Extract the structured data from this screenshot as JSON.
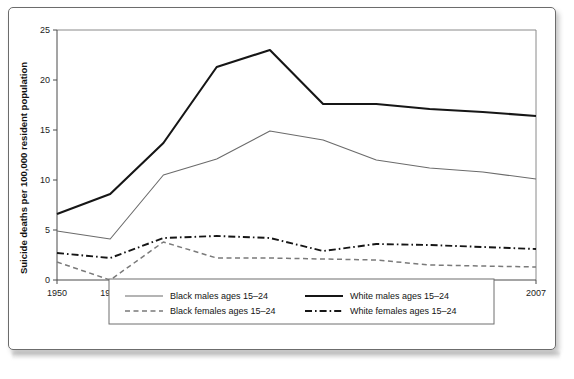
{
  "figure": {
    "background_color": "#ffffff",
    "border_color": "#6c6c6c"
  },
  "chart_data": {
    "type": "line",
    "title": "",
    "xlabel": "Year",
    "ylabel": "Suicide deaths per 100,000 resident population",
    "categories": [
      "1950",
      "1960",
      "1970",
      "1980",
      "1990",
      "2000",
      "2004",
      "2005",
      "2006",
      "2007"
    ],
    "ytick_labels": [
      "0",
      "5",
      "10",
      "15",
      "20",
      "25"
    ],
    "yticks": [
      0,
      5,
      10,
      15,
      20,
      25
    ],
    "ylim": [
      0,
      25
    ],
    "grid": false,
    "legend_position": "bottom",
    "series": [
      {
        "name": "Black males ages 15–24",
        "style": "solid-thin",
        "color": "#6b6b6b",
        "values": [
          4.9,
          4.1,
          10.5,
          12.1,
          14.9,
          14.0,
          12.0,
          11.2,
          10.8,
          10.1
        ]
      },
      {
        "name": "White males ages 15–24",
        "style": "solid-thick",
        "color": "#161616",
        "values": [
          6.6,
          8.6,
          13.7,
          21.3,
          23.0,
          17.6,
          17.6,
          17.1,
          16.8,
          16.4
        ]
      },
      {
        "name": "Black females ages 15–24",
        "style": "dashed",
        "color": "#7a7a7a",
        "values": [
          1.8,
          0.0,
          3.8,
          2.2,
          2.2,
          2.1,
          2.0,
          1.5,
          1.4,
          1.3
        ]
      },
      {
        "name": "White females ages 15–24",
        "style": "dash-dot",
        "color": "#161616",
        "values": [
          2.7,
          2.2,
          4.2,
          4.4,
          4.2,
          2.9,
          3.6,
          3.5,
          3.3,
          3.1
        ]
      }
    ]
  },
  "legend": {
    "entries": [
      {
        "label": "Black males ages 15–24",
        "style": "solid-thin"
      },
      {
        "label": "White males ages 15–24",
        "style": "solid-thick"
      },
      {
        "label": "Black females ages 15–24",
        "style": "dashed"
      },
      {
        "label": "White females ages 15–24",
        "style": "dash-dot"
      }
    ]
  }
}
